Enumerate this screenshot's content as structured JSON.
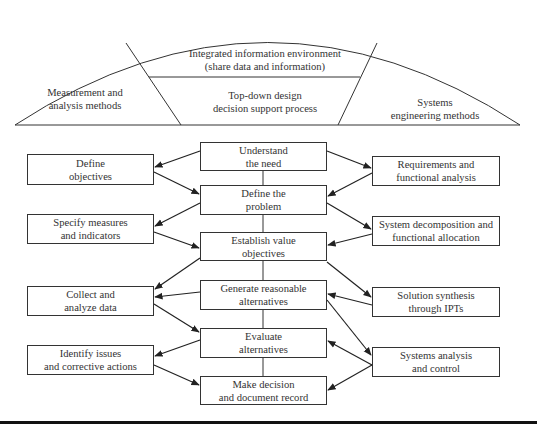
{
  "arc": {
    "left": {
      "line1": "Measurement and",
      "line2": "analysis methods"
    },
    "center_top": {
      "line1": "Integrated information environment",
      "line2": "(share data and information)"
    },
    "center_bottom": {
      "line1": "Top-down design",
      "line2": "decision support process"
    },
    "right": {
      "line1": "Systems",
      "line2": "engineering methods"
    }
  },
  "center_steps": [
    {
      "line1": "Understand",
      "line2": "the need"
    },
    {
      "line1": "Define the",
      "line2": "problem"
    },
    {
      "line1": "Establish value",
      "line2": "objectives"
    },
    {
      "line1": "Generate reasonable",
      "line2": "alternatives"
    },
    {
      "line1": "Evaluate",
      "line2": "alternatives"
    },
    {
      "line1": "Make decision",
      "line2": "and document record"
    }
  ],
  "left_methods": [
    {
      "line1": "Define",
      "line2": "objectives"
    },
    {
      "line1": "Specify measures",
      "line2": "and indicators"
    },
    {
      "line1": "Collect and",
      "line2": "analyze data"
    },
    {
      "line1": "Identify issues",
      "line2": "and corrective actions"
    }
  ],
  "right_methods": [
    {
      "line1": "Requirements and",
      "line2": "functional analysis"
    },
    {
      "line1": "System decomposition and",
      "line2": "functional allocation"
    },
    {
      "line1": "Solution synthesis",
      "line2": "through IPTs"
    },
    {
      "line1": "Systems analysis",
      "line2": "and control"
    }
  ],
  "colors": {
    "line": "#333333",
    "rule": "#111111",
    "background": "#ffffff"
  }
}
